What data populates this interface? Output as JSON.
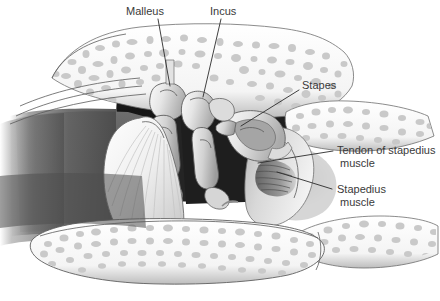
{
  "figure": {
    "width": 440,
    "height": 301,
    "background": "#ffffff",
    "style": "grayscale medical line illustration"
  },
  "labels": [
    {
      "id": "malleus",
      "text": "Malleus",
      "x": 126,
      "y": 15,
      "anchor": "start",
      "leader": "M 158 19 L 170 86"
    },
    {
      "id": "incus",
      "text": "Incus",
      "x": 210,
      "y": 15,
      "anchor": "start",
      "leader": "M 221 19 L 203 97"
    },
    {
      "id": "stapes",
      "text": "Stapes",
      "x": 302,
      "y": 89,
      "anchor": "start",
      "leader": "M 299 90 L 241 126"
    },
    {
      "id": "tendon-of-stapedius-muscle",
      "text": "Tendon of stapedius",
      "text2": "muscle",
      "x": 337,
      "y": 154,
      "x2": 340,
      "y2": 167,
      "anchor": "start",
      "leader": "M 333 151 L 258 163"
    },
    {
      "id": "stapedius-muscle",
      "text": "Stapedius",
      "text2": "muscle",
      "x": 337,
      "y": 193,
      "x2": 340,
      "y2": 206,
      "anchor": "start",
      "leader": "M 332 189 L 277 172"
    }
  ],
  "colors": {
    "label_text": "#3a3a3a",
    "leader_line": "#2b2b2b",
    "bone_fill": "#ffffff",
    "trabecula": "#c9c9c9",
    "cavity_dark": "#1c1c1c",
    "canal_gray": "#5a5a5a",
    "ossicle_light": "#eeeeee",
    "ossicle_shade": "#b6b6b6",
    "membrane": "#e8e8e8",
    "outline": "#5a5a5a"
  },
  "structures": [
    {
      "id": "mastoid-bone-upper",
      "name": "Upper temporal bone with trabeculae"
    },
    {
      "id": "mastoid-bone-lower",
      "name": "Lower bony ear canal floor with trabeculae"
    },
    {
      "id": "tympanic-cavity",
      "name": "Tympanic cavity (dark attic space)"
    },
    {
      "id": "malleus-bone",
      "name": "Malleus ossicle"
    },
    {
      "id": "incus-bone",
      "name": "Incus ossicle"
    },
    {
      "id": "stapes-bone",
      "name": "Stapes ossicle (stirrup)"
    },
    {
      "id": "tympanic-membrane",
      "name": "Tympanic membrane with radiating fibers"
    },
    {
      "id": "external-canal",
      "name": "External auditory canal (gradient shading)"
    },
    {
      "id": "pyramidal-eminence",
      "name": "Pyramidal eminence housing stapedius"
    },
    {
      "id": "stapedius-muscle-body",
      "name": "Stapedius muscle striations"
    },
    {
      "id": "stapedius-tendon",
      "name": "Tendon of stapedius muscle"
    }
  ]
}
